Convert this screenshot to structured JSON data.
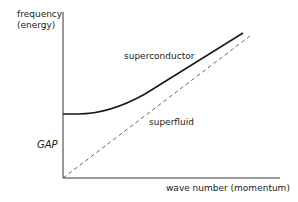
{
  "diagram": {
    "axes": {
      "y_label_line1": "frequency",
      "y_label_line2": "(energy)",
      "x_label": "wave number (momentum)"
    },
    "annotations": {
      "gap": "GAP",
      "superconductor": "superconductor",
      "superfluid": "superfluid"
    },
    "curves": [
      {
        "name": "superconductor",
        "style": "solid",
        "color": "#1a1a1a",
        "description": "starts at nonzero energy (gap) at zero wave number, flat then rising roughly linearly"
      },
      {
        "name": "superfluid",
        "style": "dashed",
        "color": "#555555",
        "description": "linear from origin"
      }
    ]
  }
}
